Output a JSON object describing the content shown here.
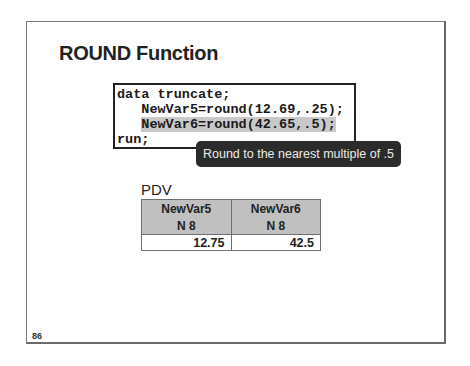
{
  "slide": {
    "title": "ROUND Function",
    "number": "86"
  },
  "code": {
    "lines": [
      "data truncate;",
      "   NewVar5=round(12.69,.25);",
      "   NewVar6=round(42.65,.5);",
      "run;"
    ],
    "highlighted_line_index": 2,
    "line3_indent": "   ",
    "line3_code": "NewVar6=round(42.65,.5);"
  },
  "callout": {
    "text": "Round to the nearest multiple of .5"
  },
  "pdv": {
    "label": "PDV",
    "columns": [
      {
        "name": "NewVar5",
        "type": "N 8",
        "value": "12.75"
      },
      {
        "name": "NewVar6",
        "type": "N 8",
        "value": "42.5"
      }
    ]
  },
  "colors": {
    "highlight": "#c9c9c9",
    "callout_bg": "#2b2b2b",
    "table_header_bg": "#c0c0c0"
  }
}
